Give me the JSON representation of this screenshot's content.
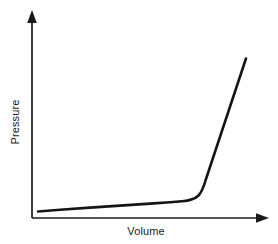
{
  "chart_data": {
    "type": "line",
    "title": "",
    "subtitle": "",
    "xlabel": "Volume",
    "ylabel": "Pressure",
    "grid": false,
    "legend": null,
    "axis_style": {
      "arrows": true,
      "tick_labels": false,
      "ticks": false,
      "x_axis_color": "#1a1a1a",
      "y_axis_color": "#1a1a1a"
    },
    "xlim": [
      0,
      1
    ],
    "ylim": [
      0,
      1
    ],
    "series": [
      {
        "name": "isotherm",
        "color": "#151515",
        "line_width": 2.6,
        "x": [
          0.03,
          0.1,
          0.2,
          0.3,
          0.4,
          0.5,
          0.58,
          0.64,
          0.68,
          0.71,
          0.735,
          0.75,
          0.77,
          0.8,
          0.85,
          0.9,
          0.95,
          1.0
        ],
        "y": [
          0.035,
          0.046,
          0.058,
          0.068,
          0.078,
          0.088,
          0.096,
          0.104,
          0.115,
          0.135,
          0.17,
          0.215,
          0.29,
          0.4,
          0.56,
          0.7,
          0.82,
          0.93
        ]
      }
    ],
    "annotations": []
  },
  "canvas": {
    "width": 278,
    "height": 244,
    "background": "#ffffff"
  },
  "axes_geometry": {
    "origin_x": 32,
    "origin_y": 218,
    "y_axis_top": 12,
    "x_axis_right": 268
  },
  "curve_path": "M 38,211.5 L 60,209.8 L 90,207.6 L 120,205.6 L 150,203.6 L 170,202.3 L 182,201.3 C 190,200.6 195,199.0 198.5,195.5 C 202,191.8 204,186.0 206,179.0 L 246,58.5",
  "colors": {
    "axis": "#1a1a1a",
    "curve": "#151515",
    "label_text": "#1a1a1a",
    "background": "#ffffff"
  }
}
